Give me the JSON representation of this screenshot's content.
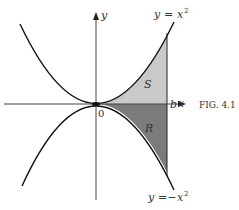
{
  "figure": {
    "caption": "Fig. 4.1",
    "caption_display": "FIG. 4.1",
    "axes": {
      "x_label": "x",
      "y_label": "y",
      "origin_label": "0",
      "b_label": "b"
    },
    "curves": [
      {
        "name": "upper-parabola",
        "label_lhs": "y",
        "label_eq": "=",
        "label_rhs": "x",
        "label_exp": "2",
        "equation": "y = x^2"
      },
      {
        "name": "lower-parabola",
        "label_lhs": "y",
        "label_eq": "=−",
        "label_rhs": "x",
        "label_exp": "2",
        "equation": "y = -x^2"
      }
    ],
    "regions": [
      {
        "name": "S",
        "label": "S",
        "description": "area between y=0 and y=x^2 from 0 to b",
        "fill": "#c8c8c8"
      },
      {
        "name": "R",
        "label": "R",
        "description": "area between y=-x^2 and y=0 from 0 to b",
        "fill": "#7a7a7a"
      }
    ],
    "colors": {
      "stroke": "#111111",
      "axis": "#333333",
      "text": "#333333"
    }
  }
}
